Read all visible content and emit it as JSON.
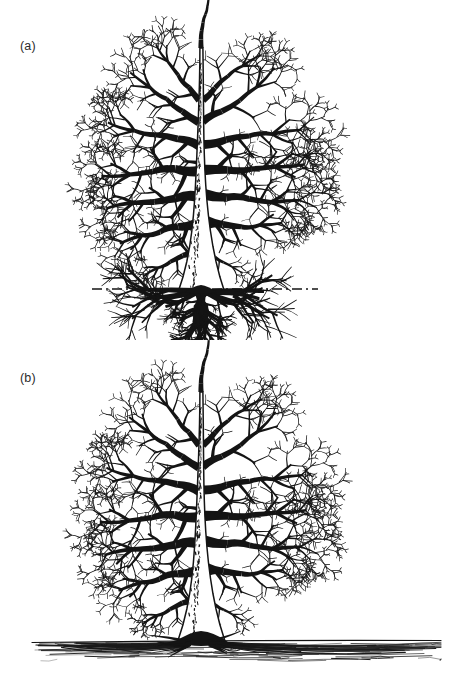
{
  "figure": {
    "background_color": "#ffffff",
    "ink_color": "#141414",
    "width": 451,
    "height": 679
  },
  "panels": [
    {
      "id": "a",
      "label": "(a)",
      "caption_text": "(a)",
      "description": "Deciduous tree with deep, heart/taproot-type root system shown below a dash-dot soil surface line",
      "ground": {
        "style": "dash-dot",
        "y": 289,
        "x_start": 92,
        "x_end": 318,
        "dash_pattern": "10 4 2 4",
        "stroke_width": 1.4
      },
      "crown": {
        "top_y": 38,
        "left_x": 90,
        "right_x": 312,
        "bottom_y": 289
      },
      "trunk": {
        "center_x": 201,
        "top_y": 48,
        "base_y": 292,
        "base_width": 15,
        "top_width": 3,
        "bark_texture": "speckled"
      },
      "roots": {
        "type": "deep",
        "max_depth_y": 358,
        "left_spread_x": 96,
        "right_spread_x": 312,
        "visible": true
      }
    },
    {
      "id": "b",
      "label": "(b)",
      "caption_text": "(b)",
      "description": "Same deciduous tree with shallow, wide-spreading surface root system at a solid soil line",
      "ground": {
        "style": "solid",
        "y": 641,
        "x_start": 32,
        "x_end": 441,
        "dash_pattern": "none",
        "stroke_width": 1.2
      },
      "crown": {
        "top_y": 382,
        "left_x": 90,
        "right_x": 312,
        "bottom_y": 634
      },
      "trunk": {
        "center_x": 201,
        "top_y": 392,
        "base_y": 640,
        "base_width": 15,
        "top_width": 3,
        "bark_texture": "speckled"
      },
      "roots": {
        "type": "shallow-spreading",
        "max_depth_y": 664,
        "left_spread_x": 34,
        "right_spread_x": 438,
        "visible": true
      }
    }
  ],
  "chart_data": {
    "type": "diagram",
    "series": [
      {
        "name": "(a) deep root system",
        "crown_height_px": 251,
        "crown_width_px": 222,
        "root_depth_px": 69,
        "root_spread_px": 216,
        "ground_line_style": "dash-dot"
      },
      {
        "name": "(b) shallow root system",
        "crown_height_px": 252,
        "crown_width_px": 222,
        "root_depth_px": 23,
        "root_spread_px": 404,
        "ground_line_style": "solid"
      }
    ]
  }
}
